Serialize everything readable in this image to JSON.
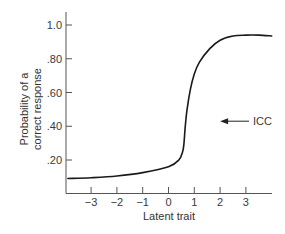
{
  "chart_data": {
    "type": "line",
    "title": "",
    "xlabel": "Latent trait",
    "ylabel_lines": [
      "Probability of a",
      "correct response"
    ],
    "ylabel": "Probability of a correct response",
    "xlim": [
      -3.9,
      4.0
    ],
    "ylim": [
      0,
      1.05
    ],
    "x_ticks": [
      -3,
      -2,
      -1,
      0,
      1,
      2,
      3
    ],
    "x_tick_labels": [
      "−3",
      "−2",
      "−1",
      "0",
      "1",
      "2",
      "3"
    ],
    "y_ticks": [
      0.2,
      0.4,
      0.6,
      0.8,
      1.0
    ],
    "y_tick_labels": [
      ".20",
      ".40",
      ".60",
      ".80",
      "1.0"
    ],
    "grid": false,
    "legend": null,
    "series": [
      {
        "name": "ICC",
        "x": [
          -3.9,
          -3.0,
          -2.0,
          -1.0,
          0.0,
          0.4,
          0.55,
          0.6,
          0.65,
          0.72,
          0.85,
          1.0,
          1.2,
          1.6,
          2.0,
          2.5,
          3.0,
          3.5,
          4.0
        ],
        "y": [
          0.09,
          0.095,
          0.105,
          0.125,
          0.16,
          0.2,
          0.25,
          0.3,
          0.4,
          0.5,
          0.62,
          0.71,
          0.78,
          0.86,
          0.91,
          0.935,
          0.94,
          0.94,
          0.935
        ]
      }
    ],
    "annotations": [
      {
        "text": "ICC",
        "arrow_to": [
          2.0,
          0.43
        ],
        "text_at": [
          3.3,
          0.43
        ]
      }
    ],
    "line_color": "#1a1a1a"
  }
}
